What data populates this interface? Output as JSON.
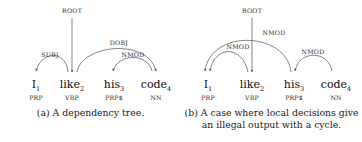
{
  "figure": {
    "background": "#ffffff",
    "ink": "#262626",
    "arc_color": "#4d4d4d"
  },
  "panels": [
    {
      "id": "a",
      "caption": "(a) A dependency tree.",
      "root": {
        "label": "ROOT",
        "target": "like"
      },
      "tokens": [
        {
          "word": "I",
          "index": "1",
          "pos": "PRP"
        },
        {
          "word": "like",
          "index": "2",
          "pos": "VBP"
        },
        {
          "word": "his",
          "index": "3",
          "pos": "PRP$"
        },
        {
          "word": "code",
          "index": "4",
          "pos": "NN"
        }
      ],
      "arcs": [
        {
          "label": "SUBJ",
          "head": "like",
          "dependent": "I"
        },
        {
          "label": "DOBJ",
          "head": "like",
          "dependent": "code"
        },
        {
          "label": "NMOD",
          "head": "code",
          "dependent": "his"
        }
      ]
    },
    {
      "id": "b",
      "caption": "(b) A case where local decisions give an illegal output with a cycle.",
      "caption_line1": "(b) A case where local decisions give",
      "caption_line2": "an illegal output with a cycle.",
      "root": {
        "label": "ROOT",
        "target": "like"
      },
      "tokens": [
        {
          "word": "I",
          "index": "1",
          "pos": "PRP"
        },
        {
          "word": "like",
          "index": "2",
          "pos": "VBP"
        },
        {
          "word": "his",
          "index": "3",
          "pos": "PRP$"
        },
        {
          "word": "code",
          "index": "4",
          "pos": "NN"
        }
      ],
      "arcs": [
        {
          "label": "NMOD",
          "head": "his",
          "dependent": "I"
        },
        {
          "label": "NMOD",
          "head": "like",
          "dependent": "I"
        },
        {
          "label": "NMOD",
          "head": "code",
          "dependent": "his"
        }
      ]
    }
  ]
}
